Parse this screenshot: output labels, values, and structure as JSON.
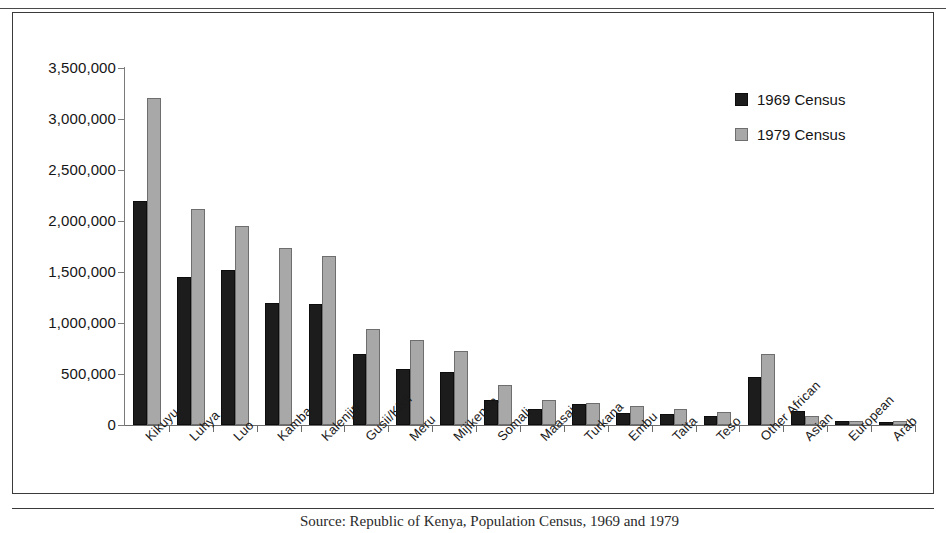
{
  "legend": {
    "position": "top-right",
    "entries": [
      {
        "label": "1969 Census",
        "color": "#1c1c1c"
      },
      {
        "label": "1979 Census",
        "color": "#a8a8a8"
      }
    ]
  },
  "source_caption": "Source: Republic of Kenya, Population Census, 1969 and 1979",
  "chart_data": {
    "type": "bar",
    "title": "",
    "subtitle": "",
    "xlabel": "",
    "ylabel": "",
    "ylim": [
      0,
      3500000
    ],
    "ytick_labels": [
      "0",
      "500,000",
      "1,000,000",
      "1,500,000",
      "2,000,000",
      "2,500,000",
      "3,000,000",
      "3,500,000"
    ],
    "ytick_values": [
      0,
      500000,
      1000000,
      1500000,
      2000000,
      2500000,
      3000000,
      3500000
    ],
    "grid": false,
    "legend_position": "top-right",
    "categories": [
      "Kikuyu",
      "Luhya",
      "Luo",
      "Kamba",
      "Kalenjin",
      "Gusii/Kisii",
      "Meru",
      "Mijikenda",
      "Somali",
      "Maasai",
      "Turkana",
      "Embu",
      "Taita",
      "Teso",
      "Other African",
      "Asian",
      "European",
      "Arab"
    ],
    "series": [
      {
        "name": "1969 Census",
        "color": "#1c1c1c",
        "values": [
          2201000,
          1453000,
          1521000,
          1197000,
          1187000,
          701000,
          554000,
          520000,
          250000,
          155000,
          203000,
          118000,
          109000,
          86000,
          475000,
          140000,
          41000,
          28000
        ]
      },
      {
        "name": "1979 Census",
        "color": "#a8a8a8",
        "values": [
          3202000,
          2122000,
          1956000,
          1734000,
          1653000,
          945000,
          830000,
          730000,
          390000,
          242000,
          215000,
          190000,
          160000,
          125000,
          695000,
          85000,
          40000,
          39000
        ]
      }
    ]
  }
}
